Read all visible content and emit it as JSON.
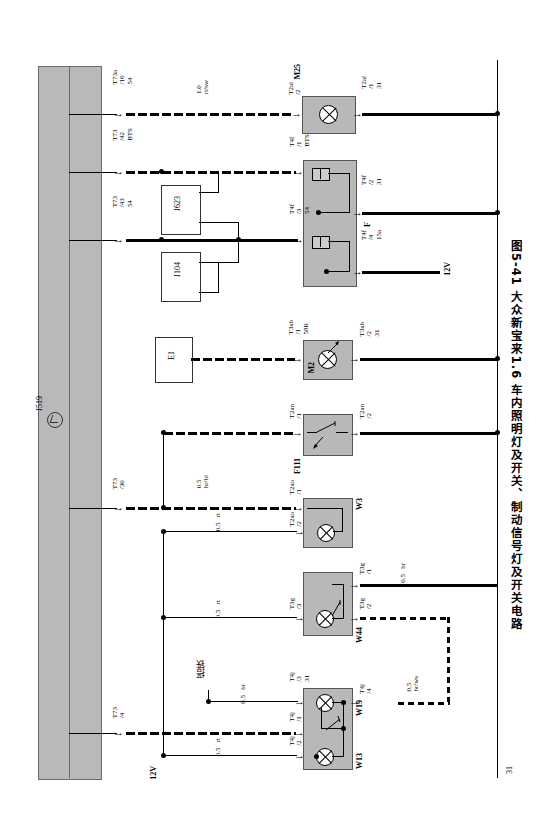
{
  "figure": {
    "number": "图5-41",
    "title": "大众新宝来1.6 车内照明灯及开关、制动信号灯及开关电路",
    "full_caption": "图5-41  大众新宝来1.6 车内照明灯及开关、制动信号灯及开关电路",
    "page_number": "31"
  },
  "main_module": {
    "label": "J519"
  },
  "components": [
    {
      "id": "J623",
      "type": "control-unit-box"
    },
    {
      "id": "J104",
      "type": "control-unit-box"
    },
    {
      "id": "E1",
      "type": "switch-box"
    },
    {
      "id": "M25",
      "type": "lamp"
    },
    {
      "id": "F",
      "type": "relay-dual"
    },
    {
      "id": "M2",
      "type": "lamp"
    },
    {
      "id": "F111",
      "type": "switch"
    },
    {
      "id": "W3",
      "type": "lamp-switch"
    },
    {
      "id": "W44",
      "type": "lamp-switch"
    },
    {
      "id": "W19",
      "type": "lamp-switch"
    },
    {
      "id": "W13",
      "type": "lamp-switch"
    }
  ],
  "left_connectors": [
    {
      "lines": [
        "T73a",
        "/16",
        "54"
      ]
    },
    {
      "lines": [
        "T73",
        "/42",
        "BTS"
      ]
    },
    {
      "lines": [
        "T73",
        "/43",
        "54"
      ]
    },
    {
      "lines": [
        "T73",
        "/30"
      ]
    },
    {
      "lines": [
        "T73",
        "/4"
      ]
    }
  ],
  "right_connectors": [
    {
      "lines": [
        "T2al",
        "/2"
      ]
    },
    {
      "lines": [
        "T2al",
        "/1",
        "31"
      ]
    },
    {
      "lines": [
        "T4f",
        "/1",
        "BTS"
      ]
    },
    {
      "lines": [
        "T4f",
        "/2",
        "31"
      ]
    },
    {
      "lines": [
        "T4f",
        "/3",
        "54"
      ]
    },
    {
      "lines": [
        "T4f",
        "/4",
        "15a"
      ]
    },
    {
      "lines": [
        "T3ab",
        "/1",
        "58R"
      ]
    },
    {
      "lines": [
        "T3ab",
        "/2",
        "31"
      ]
    },
    {
      "lines": [
        "T2an",
        "/1"
      ]
    },
    {
      "lines": [
        "T2an",
        "/2"
      ]
    },
    {
      "lines": [
        "T2ao",
        "/1"
      ]
    },
    {
      "lines": [
        "T2ao",
        "/2"
      ]
    },
    {
      "lines": [
        "T3g",
        "/3"
      ]
    },
    {
      "lines": [
        "T3g",
        "/1"
      ]
    },
    {
      "lines": [
        "T3g",
        "/2"
      ]
    },
    {
      "lines": [
        "T4j",
        "/3",
        "31"
      ]
    },
    {
      "lines": [
        "T4j",
        "/4"
      ]
    },
    {
      "lines": [
        "T4j",
        "/1"
      ]
    },
    {
      "lines": [
        "T4j",
        "/2"
      ]
    }
  ],
  "wire_labels": [
    {
      "size": "1.0",
      "color": "rt/sw"
    },
    {
      "size": "0.5",
      "color": "br/bl"
    },
    {
      "size": "0.5",
      "color": "rt"
    },
    {
      "size": "0.5",
      "color": "rt"
    },
    {
      "size": "0.5",
      "color": "br"
    },
    {
      "size": "0.5",
      "color": "br"
    },
    {
      "size": "0.5",
      "color": "br/ws"
    },
    {
      "size": "0.5",
      "color": "rt"
    }
  ],
  "annotations": {
    "ground_cn": "搭铁",
    "supply_top": "12V",
    "supply_bottom": "12V"
  },
  "labels": {
    "m25": "M25",
    "relay_f": "F",
    "m2": "M2",
    "f111": "F111",
    "w3": "W3",
    "w44": "W44",
    "w19": "W19",
    "w13": "W13",
    "j623": "J623",
    "j104": "J104",
    "e1": "E1",
    "j519": "J519"
  }
}
